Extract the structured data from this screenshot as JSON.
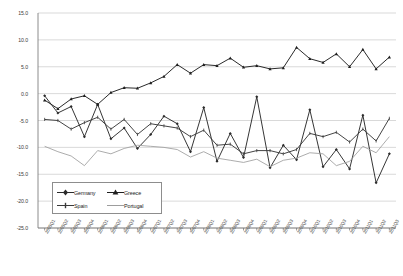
{
  "chart_data": {
    "type": "line",
    "title": "",
    "xlabel": "",
    "ylabel": "",
    "ylim": [
      -25.0,
      15.0
    ],
    "ytick_labels": [
      "15.0",
      "10.0",
      "5.0",
      "0.0",
      "-5.0",
      "-10.0",
      "-15.0",
      "-20.0",
      "-25.0"
    ],
    "ytick_values": [
      15,
      10,
      5,
      0,
      -5,
      -10,
      -15,
      -20,
      -25
    ],
    "grid": true,
    "legend_position": "inside-lower-left",
    "categories": [
      "2005Q1",
      "2005Q2",
      "2005Q3",
      "2005Q4",
      "2006Q1",
      "2006Q2",
      "2006Q3",
      "2006Q4",
      "2007Q1",
      "2007Q2",
      "2007Q3",
      "2007Q4",
      "2008Q1",
      "2008Q2",
      "2008Q3",
      "2008Q4",
      "2009Q1",
      "2009Q2",
      "2009Q3",
      "2009Q4",
      "2010Q1",
      "2010Q2",
      "2010Q3",
      "2010Q4",
      "2011Q1",
      "2011Q2",
      "2011Q3"
    ],
    "series": [
      {
        "name": "Germany",
        "color": "#2b2b2b",
        "marker": "diamond",
        "values": [
          -0.4,
          -3.6,
          -2.4,
          -8.0,
          -2.0,
          -8.4,
          -6.4,
          -10.2,
          -7.6,
          -4.2,
          -5.6,
          -10.8,
          -2.6,
          -12.6,
          -7.4,
          -11.9,
          -0.6,
          -13.8,
          -9.6,
          -12.3,
          -3.0,
          -13.6,
          -10.4,
          -14.0,
          -4.0,
          -16.6,
          -11.2
        ]
      },
      {
        "name": "Greece",
        "color": "#1f1f1f",
        "marker": "triangle",
        "values": [
          -1.2,
          -2.8,
          -1.0,
          -0.4,
          -2.0,
          0.2,
          1.1,
          1.0,
          2.0,
          3.2,
          5.4,
          3.8,
          5.4,
          5.2,
          6.6,
          4.9,
          5.2,
          4.6,
          4.8,
          8.6,
          6.5,
          5.8,
          7.4,
          5.0,
          8.2,
          4.6,
          6.8
        ]
      },
      {
        "name": "Spain",
        "color": "#3a3a3a",
        "marker": "plus",
        "values": [
          -4.8,
          -5.0,
          -6.6,
          -5.4,
          -4.4,
          -6.6,
          -4.8,
          -7.6,
          -5.6,
          -6.0,
          -6.4,
          -8.0,
          -6.8,
          -9.6,
          -9.4,
          -11.2,
          -10.6,
          -10.6,
          -11.2,
          -10.4,
          -7.4,
          -8.0,
          -7.2,
          -9.0,
          -6.6,
          -8.8,
          -4.6
        ]
      },
      {
        "name": "Portugal",
        "color": "#9d9d9d",
        "marker": "none",
        "values": [
          -9.8,
          -10.8,
          -11.6,
          -13.4,
          -10.6,
          -11.2,
          -10.2,
          -9.6,
          -9.8,
          -10.0,
          -10.4,
          -11.8,
          -10.8,
          -12.0,
          -12.4,
          -12.8,
          -12.2,
          -13.6,
          -12.4,
          -12.0,
          -11.0,
          -11.2,
          -13.4,
          -12.6,
          -9.8,
          -11.0,
          -8.0
        ]
      }
    ]
  }
}
